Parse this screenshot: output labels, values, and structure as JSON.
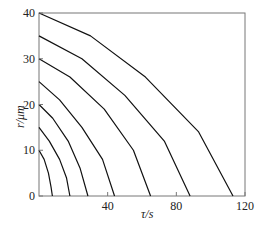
{
  "chart_data": {
    "type": "line",
    "title": "",
    "xlabel": "τ/s",
    "ylabel": "r/μm",
    "xlim": [
      0,
      120
    ],
    "ylim": [
      0,
      40
    ],
    "xticks": [
      "40",
      "80",
      "120"
    ],
    "yticks": [
      "0",
      "10",
      "20",
      "30",
      "40"
    ],
    "grid": false,
    "legend": "none",
    "series": [
      {
        "name": "r0=10",
        "x": [
          0,
          3,
          5.5,
          7,
          7.8
        ],
        "y": [
          10,
          8,
          5,
          2,
          0
        ]
      },
      {
        "name": "r0=15",
        "x": [
          0,
          6,
          12,
          16,
          18
        ],
        "y": [
          15,
          12,
          8,
          4,
          0
        ]
      },
      {
        "name": "r0=20",
        "x": [
          0,
          8,
          17,
          24,
          28.5
        ],
        "y": [
          20,
          17,
          12,
          6,
          0
        ]
      },
      {
        "name": "r0=25",
        "x": [
          0,
          12,
          25,
          37,
          44
        ],
        "y": [
          25,
          21,
          15,
          8,
          0
        ]
      },
      {
        "name": "r0=30",
        "x": [
          0,
          18,
          38,
          55,
          65
        ],
        "y": [
          30,
          26,
          19,
          10,
          0
        ]
      },
      {
        "name": "r0=35",
        "x": [
          0,
          25,
          50,
          73,
          88
        ],
        "y": [
          35,
          30,
          22,
          12,
          0
        ]
      },
      {
        "name": "r0=40",
        "x": [
          0,
          30,
          62,
          93,
          113
        ],
        "y": [
          40,
          35,
          26,
          14,
          0
        ]
      }
    ]
  }
}
